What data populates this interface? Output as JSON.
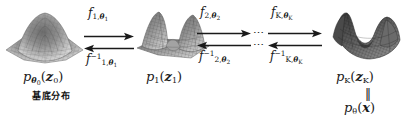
{
  "figure": {
    "ink_color": "#1a1a1a",
    "background": "#ffffff"
  },
  "surfaces": [
    {
      "id": "base-density-surface",
      "caption": "unimodal gaussian bump, light gray mesh"
    },
    {
      "id": "intermediate-density-surface",
      "caption": "two-peak warped mesh surface"
    },
    {
      "id": "final-density-surface",
      "caption": "dark multimodal folded surface"
    }
  ],
  "labels": {
    "p0": {
      "p": "p",
      "sub_theta": "θ",
      "sub_theta_idx": "0",
      "arg_open": "(",
      "arg": "z",
      "arg_idx": "0",
      "arg_close": ")"
    },
    "p1": {
      "p": "p",
      "sub": "1",
      "arg_open": "(",
      "arg": "z",
      "arg_idx": "1",
      "arg_close": ")"
    },
    "pK": {
      "p": "p",
      "sub": "K",
      "arg_open": "(",
      "arg": "z",
      "arg_idx": "K",
      "arg_close": ")"
    },
    "ptheta": {
      "p": "p",
      "sub_theta": "θ",
      "arg_open": "(",
      "arg": "x",
      "arg_close": ")"
    },
    "equals_sign": "‖",
    "base_distribution_cjk": "基底分布"
  },
  "transforms": [
    {
      "id": "f1",
      "forward": {
        "f": "f",
        "index": "1",
        "theta": "θ",
        "theta_idx": "1",
        "comma": ","
      },
      "inverse": {
        "f": "f",
        "index": "1",
        "theta": "θ",
        "theta_idx": "1",
        "comma": ",",
        "power": "−1"
      }
    },
    {
      "id": "f2",
      "forward": {
        "f": "f",
        "index": "2",
        "theta": "θ",
        "theta_idx": "2",
        "comma": ","
      },
      "inverse": {
        "f": "f",
        "index": "2",
        "theta": "θ",
        "theta_idx": "2",
        "comma": ",",
        "power": "−1"
      }
    },
    {
      "id": "fK",
      "forward": {
        "f": "f",
        "index": "K",
        "theta": "θ",
        "theta_idx": "K",
        "comma": ","
      },
      "inverse": {
        "f": "f",
        "index": "K",
        "theta": "θ",
        "theta_idx": "K",
        "comma": ",",
        "power": "−1"
      }
    }
  ],
  "ellipses": {
    "top": "⋯",
    "bottom": "⋯"
  }
}
